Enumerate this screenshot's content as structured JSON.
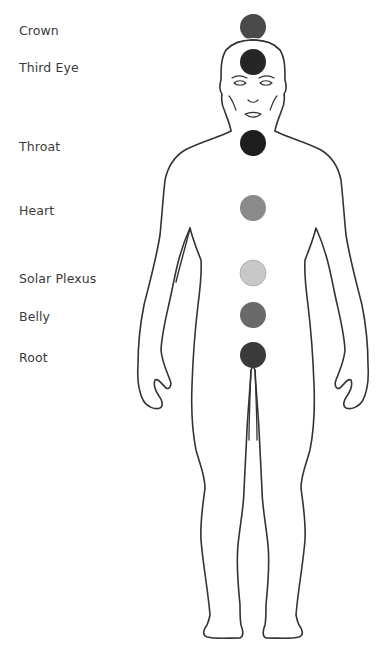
{
  "diagram": {
    "chakras": [
      {
        "label": "Crown",
        "cx": 253,
        "cy": 27,
        "r": 13,
        "color": "#4a4a4a",
        "label_y": 30
      },
      {
        "label": "Third Eye",
        "cx": 253,
        "cy": 62,
        "r": 13,
        "color": "#262626",
        "label_y": 67
      },
      {
        "label": "Throat",
        "cx": 253,
        "cy": 143,
        "r": 13,
        "color": "#1e1e1e",
        "label_y": 146
      },
      {
        "label": "Heart",
        "cx": 253,
        "cy": 208,
        "r": 13,
        "color": "#8a8a8a",
        "label_y": 210
      },
      {
        "label": "Solar Plexus",
        "cx": 253,
        "cy": 273,
        "r": 13,
        "color": "#c8c8c8",
        "label_y": 278
      },
      {
        "label": "Belly",
        "cx": 253,
        "cy": 315,
        "r": 13,
        "color": "#6a6a6a",
        "label_y": 316
      },
      {
        "label": "Root",
        "cx": 253,
        "cy": 355,
        "r": 13,
        "color": "#3a3a3a",
        "label_y": 357
      }
    ],
    "outline_color": "#333333"
  }
}
